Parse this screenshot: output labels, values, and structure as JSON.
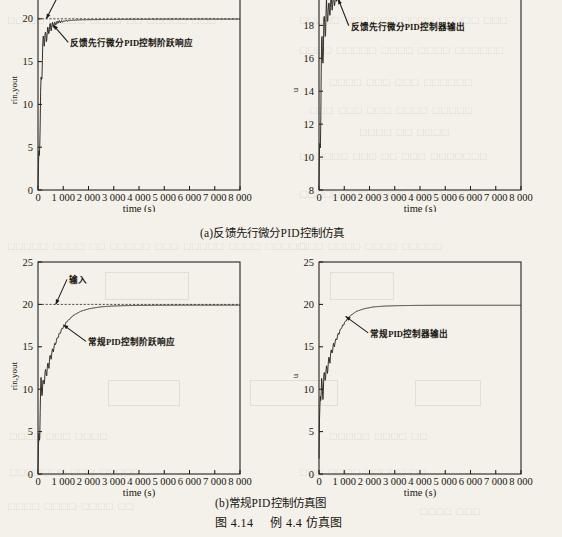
{
  "figure": {
    "caption_label": "图 4.14",
    "caption_text": "例 4.4 仿真图",
    "subcaption_a": "(a)反馈先行微分PID控制仿真",
    "subcaption_b": "(b)常规PID控制仿真图"
  },
  "chart_data": [
    {
      "id": "a-left",
      "type": "line",
      "title": "",
      "xlabel": "time (s)",
      "ylabel": "rin,yout",
      "xlim": [
        0,
        8000
      ],
      "ylim": [
        0,
        25
      ],
      "xticks": [
        0,
        1000,
        2000,
        3000,
        4000,
        5000,
        6000,
        7000,
        8000
      ],
      "xticklabels": [
        "0",
        "1 000",
        "2 000",
        "3 000",
        "4 000",
        "5 000",
        "6 000",
        "7 000",
        "8 000"
      ],
      "yticks": [
        0,
        5,
        10,
        15,
        20
      ],
      "yticklabels": [
        "0",
        "5",
        "10",
        "15",
        "20"
      ],
      "grid": false,
      "legend": "none",
      "clipped_top": true,
      "annotations": [
        {
          "text": "输入",
          "x": 950,
          "y": 23.2,
          "points_to": {
            "x": 330,
            "y": 20.0
          }
        },
        {
          "text": "反馈先行微分PID控制阶跃响应",
          "x": 1200,
          "y": 16.9,
          "points_to": {
            "x": 600,
            "y": 19.3
          }
        }
      ],
      "series": [
        {
          "name": "输入",
          "style": "dashed",
          "x": [
            0,
            8000
          ],
          "values": [
            20,
            20
          ]
        },
        {
          "name": "反馈先行微分PID控制阶跃响应",
          "style": "solid",
          "x": [
            0,
            60,
            120,
            180,
            230,
            280,
            320,
            360,
            400,
            450,
            520,
            600,
            700,
            820,
            950,
            1100,
            1300,
            1600,
            2000,
            2600,
            3400,
            4400,
            5600,
            7000,
            8000
          ],
          "values": [
            0.3,
            5.2,
            11.8,
            16.2,
            17.6,
            18.0,
            17.9,
            18.3,
            18.5,
            18.8,
            19.1,
            19.3,
            19.5,
            19.62,
            19.7,
            19.76,
            19.82,
            19.87,
            19.9,
            19.92,
            19.94,
            19.95,
            19.96,
            19.96,
            19.96
          ]
        }
      ]
    },
    {
      "id": "a-right",
      "type": "line",
      "title": "",
      "xlabel": "time (s)",
      "ylabel": "u",
      "xlim": [
        0,
        8000
      ],
      "ylim": [
        8,
        21
      ],
      "xticks": [
        0,
        1000,
        2000,
        3000,
        4000,
        5000,
        6000,
        7000,
        8000
      ],
      "xticklabels": [
        "0",
        "1 000",
        "2 000",
        "3 000",
        "4 000",
        "5 000",
        "6 000",
        "7 000",
        "8 000"
      ],
      "yticks": [
        8,
        10,
        12,
        14,
        16,
        18,
        20
      ],
      "yticklabels": [
        "8",
        "10",
        "12",
        "14",
        "16",
        "18",
        "20"
      ],
      "grid": false,
      "legend": "none",
      "clipped_top": true,
      "annotations": [
        {
          "text": "反馈先行微分PID控制器输出",
          "x": 1180,
          "y": 17.8,
          "points_to": {
            "x": 760,
            "y": 19.6
          }
        }
      ],
      "series": [
        {
          "name": "反馈先行微分PID控制器输出",
          "style": "solid-noisy",
          "x": [
            0,
            40,
            90,
            140,
            190,
            240,
            300,
            360,
            420,
            500,
            600,
            720,
            860,
            1000,
            1200,
            1500,
            1900,
            2400,
            3200,
            4200,
            5400,
            6600,
            8000
          ],
          "values": [
            8.2,
            10.1,
            15.9,
            16.3,
            17.6,
            18.2,
            18.6,
            18.9,
            19.1,
            19.3,
            19.5,
            19.65,
            19.75,
            19.82,
            19.87,
            19.9,
            19.92,
            19.93,
            19.94,
            19.95,
            19.95,
            19.95,
            19.95
          ]
        }
      ]
    },
    {
      "id": "b-left",
      "type": "line",
      "title": "",
      "xlabel": "time (s)",
      "ylabel": "rin,yout",
      "xlim": [
        0,
        8000
      ],
      "ylim": [
        0,
        25
      ],
      "xticks": [
        0,
        1000,
        2000,
        3000,
        4000,
        5000,
        6000,
        7000,
        8000
      ],
      "xticklabels": [
        "0",
        "1 000",
        "2 000",
        "3 000",
        "4 000",
        "5 000",
        "6 000",
        "7 000",
        "8 000"
      ],
      "yticks": [
        0,
        5,
        10,
        15,
        20,
        25
      ],
      "yticklabels": [
        "0",
        "5",
        "10",
        "15",
        "20",
        "25"
      ],
      "grid": false,
      "legend": "none",
      "clipped_top": false,
      "annotations": [
        {
          "text": "输入",
          "x": 1150,
          "y": 22.6,
          "points_to": {
            "x": 700,
            "y": 20.0
          }
        },
        {
          "text": "常规PID控制阶跃响应",
          "x": 1900,
          "y": 15.3,
          "points_to": {
            "x": 1000,
            "y": 17.6
          }
        }
      ],
      "series": [
        {
          "name": "输入",
          "style": "dashed",
          "x": [
            0,
            8000
          ],
          "values": [
            20,
            20
          ]
        },
        {
          "name": "常规PID控制阶跃响应",
          "style": "solid-noisy",
          "x": [
            0,
            60,
            110,
            160,
            210,
            260,
            320,
            380,
            450,
            540,
            650,
            780,
            950,
            1150,
            1400,
            1700,
            2050,
            2450,
            2900,
            3400,
            4000,
            4800,
            5800,
            7000,
            8000
          ],
          "values": [
            0.4,
            5.4,
            9.9,
            10.2,
            10.4,
            11.6,
            11.9,
            12.6,
            13.3,
            14.2,
            15.1,
            16.1,
            17.1,
            18.0,
            18.7,
            19.2,
            19.5,
            19.7,
            19.8,
            19.85,
            19.88,
            19.9,
            19.91,
            19.91,
            19.91
          ]
        }
      ]
    },
    {
      "id": "b-right",
      "type": "line",
      "title": "",
      "xlabel": "time (s)",
      "ylabel": "u",
      "xlim": [
        0,
        8000
      ],
      "ylim": [
        0,
        25
      ],
      "xticks": [
        0,
        1000,
        2000,
        3000,
        4000,
        5000,
        6000,
        7000,
        8000
      ],
      "xticklabels": [
        "0",
        "1 000",
        "2 000",
        "3 000",
        "4 000",
        "5 000",
        "6 000",
        "7 000",
        "8 000"
      ],
      "yticks": [
        0,
        5,
        10,
        15,
        20,
        25
      ],
      "yticklabels": [
        "0",
        "5",
        "10",
        "15",
        "20",
        "25"
      ],
      "grid": false,
      "legend": "none",
      "clipped_top": false,
      "annotations": [
        {
          "text": "常规PID控制器输出",
          "x": 1950,
          "y": 16.3,
          "points_to": {
            "x": 1050,
            "y": 18.6
          }
        }
      ],
      "series": [
        {
          "name": "常规PID控制器输出",
          "style": "solid-noisy",
          "x": [
            0,
            50,
            100,
            150,
            200,
            250,
            310,
            370,
            440,
            520,
            620,
            740,
            880,
            1050,
            1250,
            1500,
            1800,
            2150,
            2600,
            3100,
            3800,
            4700,
            5800,
            7000,
            8000
          ],
          "values": [
            1.8,
            9.6,
            10.3,
            9.8,
            11.3,
            11.8,
            12.2,
            13.0,
            13.8,
            14.6,
            15.4,
            16.3,
            17.2,
            18.0,
            18.7,
            19.2,
            19.5,
            19.7,
            19.8,
            19.85,
            19.88,
            19.9,
            19.9,
            19.9,
            19.9
          ]
        }
      ]
    }
  ],
  "ghost_text": [
    "已知被控对象传递函数为",
    "其中",
    "取采样时间为",
    "仿真结果如图所示",
    "常规PID控制器",
    "微分先行PID控制",
    "反馈先行微分",
    "控制系统",
    "阶跃响应曲线"
  ]
}
